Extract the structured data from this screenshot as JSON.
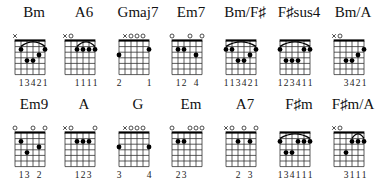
{
  "layout": {
    "string_spacing": 6,
    "fret_spacing": 5.6,
    "num_frets": 6,
    "grid_left": 15,
    "grid_top": 15,
    "colors": {
      "line": "#333333",
      "dot": "#000000",
      "background": "#ffffff"
    }
  },
  "chords": [
    {
      "name": "Bm",
      "row": 0,
      "x": 7,
      "markers": [
        "x",
        "",
        "",
        "",
        "",
        ""
      ],
      "dots": [
        [
          5,
          2
        ],
        [
          1,
          2
        ],
        [
          4,
          4
        ],
        [
          3,
          4
        ],
        [
          2,
          3
        ]
      ],
      "barre": {
        "fret": 2,
        "from": 5,
        "to": 1
      },
      "fingering": [
        "",
        "1",
        "3",
        "4",
        "2",
        "1"
      ]
    },
    {
      "name": "A6",
      "row": 0,
      "x": 57,
      "markers": [
        "x",
        "o",
        "",
        "",
        "",
        ""
      ],
      "dots": [
        [
          4,
          2
        ],
        [
          3,
          2
        ],
        [
          2,
          2
        ],
        [
          1,
          2
        ]
      ],
      "barre": {
        "fret": 2,
        "from": 4,
        "to": 1
      },
      "fingering": [
        "",
        "",
        "1",
        "1",
        "1",
        "1"
      ]
    },
    {
      "name": "Gmaj7",
      "row": 0,
      "x": 111,
      "markers": [
        "",
        "x",
        "o",
        "o",
        "o",
        ""
      ],
      "dots": [
        [
          6,
          3
        ],
        [
          1,
          2
        ]
      ],
      "barre": null,
      "fingering": [
        "2",
        "",
        "",
        "",
        "",
        "1"
      ]
    },
    {
      "name": "Em7",
      "row": 0,
      "x": 164,
      "markers": [
        "o",
        "",
        "",
        "o",
        "",
        "o"
      ],
      "dots": [
        [
          5,
          2
        ],
        [
          4,
          2
        ],
        [
          2,
          3
        ]
      ],
      "barre": null,
      "fingering": [
        "",
        "1",
        "2",
        "",
        "4",
        ""
      ]
    },
    {
      "name": "Bm/F♯",
      "row": 0,
      "x": 218,
      "markers": [
        "",
        "",
        "",
        "",
        "",
        ""
      ],
      "dots": [
        [
          6,
          2
        ],
        [
          5,
          2
        ],
        [
          4,
          4
        ],
        [
          3,
          4
        ],
        [
          2,
          3
        ],
        [
          1,
          2
        ]
      ],
      "barre": {
        "fret": 2,
        "from": 6,
        "to": 1
      },
      "fingering": [
        "1",
        "1",
        "3",
        "4",
        "2",
        "1"
      ]
    },
    {
      "name": "F♯sus4",
      "row": 0,
      "x": 272,
      "markers": [
        "",
        "",
        "",
        "",
        "",
        ""
      ],
      "dots": [
        [
          6,
          2
        ],
        [
          5,
          4
        ],
        [
          4,
          4
        ],
        [
          3,
          4
        ],
        [
          2,
          2
        ],
        [
          1,
          2
        ]
      ],
      "barre": {
        "fret": 2,
        "from": 6,
        "to": 1
      },
      "fingering": [
        "1",
        "2",
        "3",
        "4",
        "1",
        "1"
      ]
    },
    {
      "name": "Bm/A",
      "row": 0,
      "x": 326,
      "markers": [
        "x",
        "o",
        "",
        "",
        "",
        ""
      ],
      "dots": [
        [
          4,
          4
        ],
        [
          3,
          4
        ],
        [
          2,
          3
        ],
        [
          1,
          2
        ]
      ],
      "barre": null,
      "fingering": [
        "",
        "",
        "3",
        "4",
        "2",
        "1"
      ]
    },
    {
      "name": "Em9",
      "row": 1,
      "x": 7,
      "markers": [
        "o",
        "",
        "",
        "o",
        "",
        "o"
      ],
      "dots": [
        [
          5,
          2
        ],
        [
          4,
          4
        ],
        [
          2,
          3
        ]
      ],
      "barre": null,
      "fingering": [
        "",
        "1",
        "3",
        "",
        "2",
        ""
      ]
    },
    {
      "name": "A",
      "row": 1,
      "x": 57,
      "markers": [
        "x",
        "o",
        "",
        "",
        "",
        "o"
      ],
      "dots": [
        [
          4,
          2
        ],
        [
          3,
          2
        ],
        [
          2,
          2
        ]
      ],
      "barre": null,
      "fingering": [
        "",
        "",
        "1",
        "2",
        "3",
        ""
      ]
    },
    {
      "name": "G",
      "row": 1,
      "x": 111,
      "markers": [
        "",
        "x",
        "o",
        "o",
        "o",
        ""
      ],
      "dots": [
        [
          6,
          3
        ],
        [
          1,
          3
        ]
      ],
      "barre": null,
      "fingering": [
        "3",
        "",
        "",
        "",
        "",
        "4"
      ]
    },
    {
      "name": "Em",
      "row": 1,
      "x": 164,
      "markers": [
        "o",
        "",
        "",
        "o",
        "o",
        "o"
      ],
      "dots": [
        [
          5,
          2
        ],
        [
          4,
          2
        ]
      ],
      "barre": null,
      "fingering": [
        "",
        "2",
        "3",
        "",
        "",
        ""
      ]
    },
    {
      "name": "A7",
      "row": 1,
      "x": 218,
      "markers": [
        "x",
        "o",
        "",
        "o",
        "",
        "o"
      ],
      "dots": [
        [
          4,
          2
        ],
        [
          2,
          2
        ]
      ],
      "barre": null,
      "fingering": [
        "",
        "",
        "2",
        "",
        "3",
        ""
      ]
    },
    {
      "name": "F♯m",
      "row": 1,
      "x": 272,
      "markers": [
        "",
        "",
        "",
        "",
        "",
        ""
      ],
      "dots": [
        [
          6,
          2
        ],
        [
          5,
          4
        ],
        [
          4,
          4
        ],
        [
          3,
          2
        ],
        [
          2,
          2
        ],
        [
          1,
          2
        ]
      ],
      "barre": {
        "fret": 2,
        "from": 6,
        "to": 1
      },
      "fingering": [
        "1",
        "3",
        "4",
        "1",
        "1",
        "1"
      ]
    },
    {
      "name": "F♯m/A",
      "row": 1,
      "x": 326,
      "markers": [
        "x",
        "o",
        "",
        "",
        "",
        ""
      ],
      "dots": [
        [
          4,
          4
        ],
        [
          3,
          2
        ],
        [
          2,
          2
        ],
        [
          1,
          2
        ]
      ],
      "barre": {
        "fret": 2,
        "from": 3,
        "to": 1
      },
      "fingering": [
        "",
        "",
        "3",
        "1",
        "1",
        "1"
      ]
    }
  ]
}
